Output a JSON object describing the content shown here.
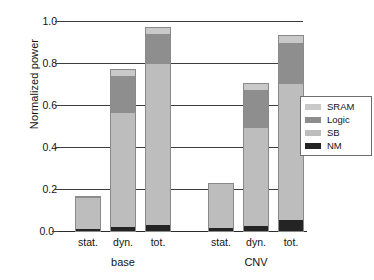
{
  "chart_data": {
    "type": "bar",
    "subtype": "stacked-bar-grouped",
    "title": "",
    "xlabel": "",
    "ylabel": "Normalized power",
    "ylim": [
      0.0,
      1.0
    ],
    "yticks": [
      "0.0",
      "0.2",
      "0.4",
      "0.6",
      "0.8",
      "1.0"
    ],
    "ytick_values": [
      0.0,
      0.2,
      0.4,
      0.6,
      0.8,
      1.0
    ],
    "grid": true,
    "grid_axis": "y",
    "legend_position": "right",
    "legend_entries": [
      "SRAM",
      "Logic",
      "SB",
      "NM"
    ],
    "groups": [
      "base",
      "CNV"
    ],
    "categories": [
      "stat.",
      "dyn.",
      "tot.",
      "stat.",
      "dyn.",
      "tot."
    ],
    "series": [
      {
        "name": "NM",
        "color": "#242424",
        "values": [
          0.012,
          0.022,
          0.035,
          0.02,
          0.028,
          0.055
        ]
      },
      {
        "name": "SB",
        "color": "#bdbdbd",
        "values": [
          0.148,
          0.543,
          0.765,
          0.213,
          0.467,
          0.65
        ]
      },
      {
        "name": "Logic",
        "color": "#8e8e8e",
        "values": [
          0.008,
          0.18,
          0.145,
          0.002,
          0.18,
          0.195
        ]
      },
      {
        "name": "SRAM",
        "color": "#c9c9c9",
        "values": [
          0.002,
          0.03,
          0.03,
          0.0,
          0.035,
          0.04
        ]
      }
    ],
    "bars": [
      {
        "group": "base",
        "category": "stat.",
        "total": 0.17,
        "segments": {
          "NM": 0.012,
          "SB": 0.148,
          "Logic": 0.008,
          "SRAM": 0.002
        }
      },
      {
        "group": "base",
        "category": "dyn.",
        "total": 0.775,
        "segments": {
          "NM": 0.022,
          "SB": 0.543,
          "Logic": 0.18,
          "SRAM": 0.03
        }
      },
      {
        "group": "base",
        "category": "tot.",
        "total": 0.975,
        "segments": {
          "NM": 0.035,
          "SB": 0.765,
          "Logic": 0.145,
          "SRAM": 0.03
        }
      },
      {
        "group": "CNV",
        "category": "stat.",
        "total": 0.235,
        "segments": {
          "NM": 0.02,
          "SB": 0.213,
          "Logic": 0.002,
          "SRAM": 0.0
        }
      },
      {
        "group": "CNV",
        "category": "dyn.",
        "total": 0.71,
        "segments": {
          "NM": 0.028,
          "SB": 0.467,
          "Logic": 0.18,
          "SRAM": 0.035
        }
      },
      {
        "group": "CNV",
        "category": "tot.",
        "total": 0.94,
        "segments": {
          "NM": 0.055,
          "SB": 0.65,
          "Logic": 0.195,
          "SRAM": 0.04
        }
      }
    ],
    "colors": {
      "SRAM": "#c9c9c9",
      "Logic": "#8e8e8e",
      "SB": "#bdbdbd",
      "NM": "#242424",
      "axis": "#3d3d3d",
      "text": "#141414",
      "background": "#ffffff"
    }
  },
  "axis": {
    "ylabel": "Normalized power",
    "yticks": [
      {
        "label": "1.0",
        "value": 1.0
      },
      {
        "label": "0.8",
        "value": 0.8
      },
      {
        "label": "0.6",
        "value": 0.6
      },
      {
        "label": "0.4",
        "value": 0.4
      },
      {
        "label": "0.2",
        "value": 0.2
      },
      {
        "label": "0.0",
        "value": 0.0
      }
    ],
    "xticks": [
      {
        "label": "stat."
      },
      {
        "label": "dyn."
      },
      {
        "label": "tot."
      },
      {
        "label": "stat."
      },
      {
        "label": "dyn."
      },
      {
        "label": "tot."
      }
    ],
    "groups": [
      {
        "label": "base"
      },
      {
        "label": "CNV"
      }
    ]
  },
  "legend": {
    "items": [
      {
        "label": "SRAM",
        "color": "#c9c9c9"
      },
      {
        "label": "Logic",
        "color": "#8e8e8e"
      },
      {
        "label": "SB",
        "color": "#bdbdbd"
      },
      {
        "label": "NM",
        "color": "#242424"
      }
    ]
  }
}
